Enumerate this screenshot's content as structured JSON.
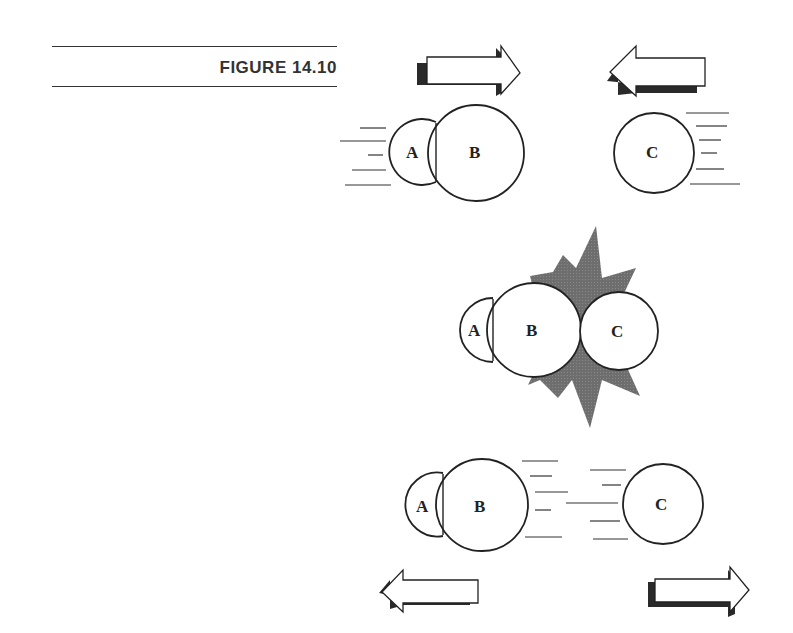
{
  "figure": {
    "title": "FIGURE 14.10"
  },
  "panels": [
    {
      "name": "before-collision",
      "bodies": [
        {
          "label": "A",
          "joined_with": "B",
          "motion": "right"
        },
        {
          "label": "B",
          "joined_with": "A",
          "motion": "right"
        },
        {
          "label": "C",
          "motion": "left"
        }
      ],
      "arrows": [
        "right",
        "left"
      ]
    },
    {
      "name": "collision",
      "bodies": [
        {
          "label": "A"
        },
        {
          "label": "B"
        },
        {
          "label": "C"
        }
      ],
      "effect": "impact-starburst"
    },
    {
      "name": "after-collision",
      "bodies": [
        {
          "label": "A",
          "motion": "left"
        },
        {
          "label": "B",
          "motion": "left"
        },
        {
          "label": "C",
          "motion": "right"
        }
      ],
      "arrows": [
        "left",
        "right"
      ]
    }
  ],
  "labels": {
    "a": "A",
    "b": "B",
    "c": "C"
  },
  "colors": {
    "outline": "#222222",
    "shadow": "#2a2a2a",
    "starburst": "#6b6b6b"
  }
}
